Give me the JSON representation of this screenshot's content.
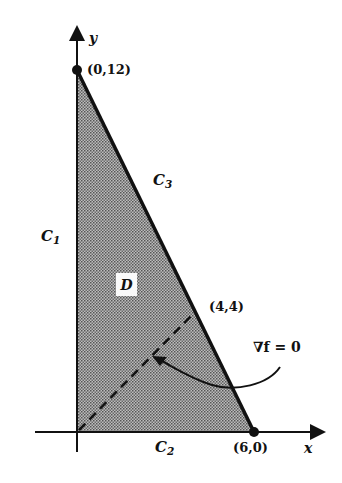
{
  "figure": {
    "type": "region diagram",
    "axes": {
      "x_label": "x",
      "y_label": "y"
    },
    "points": [
      {
        "id": "p1",
        "label": "(0,12)",
        "x": 0,
        "y": 12
      },
      {
        "id": "p2",
        "label": "(4,4)",
        "x": 4,
        "y": 4
      },
      {
        "id": "p3",
        "label": "(6,0)",
        "x": 6,
        "y": 0
      }
    ],
    "curves": {
      "c1": {
        "name": "C",
        "sub": "1"
      },
      "c2": {
        "name": "C",
        "sub": "2"
      },
      "c3": {
        "name": "C",
        "sub": "3"
      }
    },
    "region_label": "D",
    "annotation": "∇f = 0",
    "colors": {
      "ink": "#111111",
      "shade": "#8a8a8a",
      "background": "#ffffff"
    }
  }
}
